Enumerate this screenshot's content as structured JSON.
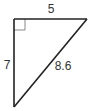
{
  "diagram": {
    "type": "right-triangle",
    "colors": {
      "stroke": "#222222",
      "right_angle_marker": "#888888",
      "label": "#333333",
      "background": "#ffffff"
    },
    "vertices": {
      "right_angle": {
        "x": 14,
        "y": 19
      },
      "top_right": {
        "x": 87,
        "y": 19
      },
      "bottom": {
        "x": 14,
        "y": 107
      }
    },
    "sides": {
      "top": {
        "label": "5"
      },
      "left": {
        "label": "7"
      },
      "hypotenuse": {
        "label": "8.6"
      }
    },
    "right_angle_marker": true
  }
}
